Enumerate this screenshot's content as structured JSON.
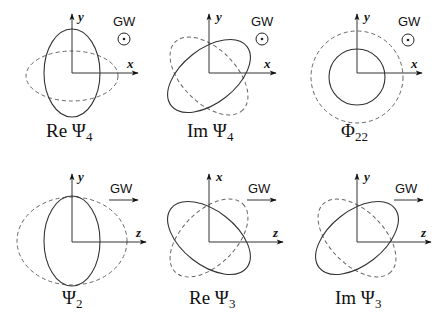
{
  "figure": {
    "propagation_label": "GW",
    "panels": [
      {
        "id": "re-psi4",
        "caption_main": "Re Ψ",
        "caption_sub": "4",
        "vertical_axis": "y",
        "horizontal_axis": "x",
        "propagation": "out-of-page",
        "propagation_symbol": "⊙",
        "solid_shape": "vertical ellipse",
        "dashed_shape": "horizontal ellipse"
      },
      {
        "id": "im-psi4",
        "caption_main": "Im Ψ",
        "caption_sub": "4",
        "vertical_axis": "y",
        "horizontal_axis": "x",
        "propagation": "out-of-page",
        "propagation_symbol": "⊙",
        "solid_shape": "ellipse tilted +45°",
        "dashed_shape": "ellipse tilted -45°"
      },
      {
        "id": "phi22",
        "caption_main": "Φ",
        "caption_sub": "22",
        "vertical_axis": "y",
        "horizontal_axis": "x",
        "propagation": "out-of-page",
        "propagation_symbol": "⊙",
        "solid_shape": "small circle",
        "dashed_shape": "large circle"
      },
      {
        "id": "psi2",
        "caption_main": "Ψ",
        "caption_sub": "2",
        "vertical_axis": "y",
        "horizontal_axis": "z",
        "propagation": "right",
        "propagation_symbol": "→",
        "solid_shape": "vertical ellipse",
        "dashed_shape": "wide ellipse"
      },
      {
        "id": "re-psi3",
        "caption_main": "Re Ψ",
        "caption_sub": "3",
        "vertical_axis": "x",
        "horizontal_axis": "z",
        "propagation": "right",
        "propagation_symbol": "→",
        "solid_shape": "ellipse tilted -45°",
        "dashed_shape": "ellipse tilted +45°"
      },
      {
        "id": "im-psi3",
        "caption_main": "Im Ψ",
        "caption_sub": "3",
        "vertical_axis": "y",
        "horizontal_axis": "z",
        "propagation": "right",
        "propagation_symbol": "→",
        "solid_shape": "ellipse tilted +45°",
        "dashed_shape": "ellipse tilted -45°"
      }
    ]
  }
}
